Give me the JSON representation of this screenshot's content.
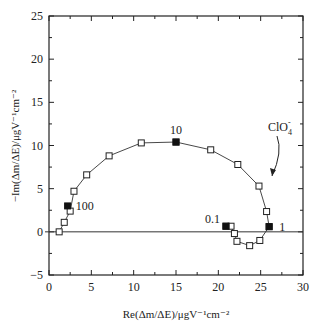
{
  "chart_data": {
    "type": "line",
    "title": "",
    "xlabel": "Re(Δm/ΔE)/μgV⁻¹cm⁻²",
    "ylabel": "−Im(Δm/ΔE)/μgV⁻¹cm⁻²",
    "xlim": [
      0,
      30
    ],
    "ylim": [
      -5,
      25
    ],
    "xticks": [
      0,
      5,
      10,
      15,
      20,
      25,
      30
    ],
    "yticks": [
      -5,
      0,
      5,
      10,
      15,
      20,
      25
    ],
    "grid": false,
    "series": [
      {
        "name": "ClO4- ac-electrogravimetry",
        "x": [
          1.2,
          1.8,
          2.5,
          2.95,
          4.45,
          7.1,
          10.9,
          15.0,
          19.1,
          22.3,
          24.8,
          25.7,
          26.0,
          24.9,
          23.7,
          22.2,
          21.9,
          21.5,
          20.9
        ],
        "y": [
          0.0,
          1.1,
          2.4,
          4.7,
          6.6,
          8.8,
          10.3,
          10.4,
          9.5,
          7.8,
          5.3,
          2.35,
          0.6,
          -1.0,
          -1.6,
          -1.1,
          -0.2,
          0.65,
          0.65
        ],
        "filled_markers": [
          {
            "x": 2.2,
            "y": 3.0,
            "label": "100"
          },
          {
            "x": 15.0,
            "y": 10.4,
            "label": "10"
          },
          {
            "x": 26.0,
            "y": 0.6,
            "label": "1"
          },
          {
            "x": 20.9,
            "y": 0.65,
            "label": "0.1"
          }
        ]
      }
    ],
    "annotations": [
      {
        "text": "ClO4-",
        "x": 27.5,
        "y": 8.5,
        "arrow_to": [
          25.6,
          3.5
        ]
      }
    ]
  },
  "labels": {
    "anion": "ClO",
    "anion_sub": "4",
    "anion_sup": "-",
    "f100": "100",
    "f10": "10",
    "f1": "1",
    "f01": "0.1"
  }
}
